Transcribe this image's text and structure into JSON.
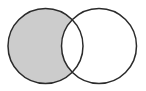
{
  "diagram": {
    "type": "venn",
    "sets": [
      {
        "id": "A",
        "cx": 45.5,
        "cy": 46,
        "r": 37.5
      },
      {
        "id": "B",
        "cx": 99,
        "cy": 46,
        "r": 37.5
      }
    ],
    "shaded_region": "A minus B",
    "colors": {
      "shade": "#cccccc",
      "stroke": "#2b2b2b",
      "background": "#ffffff"
    }
  }
}
